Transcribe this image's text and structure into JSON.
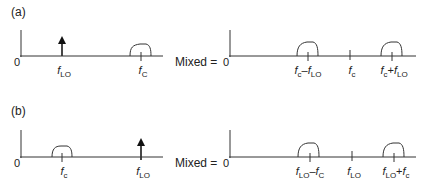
{
  "panels": [
    {
      "label": "(a)",
      "zero": "0",
      "mixed_label": "Mixed =",
      "input": {
        "components": [
          {
            "type": "impulse",
            "name": "f",
            "sub": "LO"
          },
          {
            "type": "band",
            "name": "f",
            "sub": "C"
          }
        ]
      },
      "output": {
        "components": [
          {
            "type": "band",
            "parts": [
              {
                "f": "f",
                "s": "c"
              },
              {
                "op": "–"
              },
              {
                "f": "f",
                "s": "LO"
              }
            ]
          },
          {
            "type": "tick",
            "parts": [
              {
                "f": "f",
                "s": "c"
              }
            ]
          },
          {
            "type": "band",
            "parts": [
              {
                "f": "f",
                "s": "c"
              },
              {
                "op": "+"
              },
              {
                "f": "f",
                "s": "LO"
              }
            ]
          }
        ]
      }
    },
    {
      "label": "(b)",
      "zero": "0",
      "mixed_label": "Mixed =",
      "input": {
        "components": [
          {
            "type": "band",
            "name": "f",
            "sub": "c"
          },
          {
            "type": "impulse",
            "name": "f",
            "sub": "LO"
          }
        ]
      },
      "output": {
        "components": [
          {
            "type": "band",
            "parts": [
              {
                "f": "f",
                "s": "LO"
              },
              {
                "op": "–"
              },
              {
                "f": "f",
                "s": "C"
              }
            ]
          },
          {
            "type": "tick",
            "parts": [
              {
                "f": "f",
                "s": "LO"
              }
            ]
          },
          {
            "type": "band",
            "parts": [
              {
                "f": "f",
                "s": "LO"
              },
              {
                "op": "+"
              },
              {
                "f": "f",
                "s": "c"
              }
            ]
          }
        ]
      }
    }
  ],
  "colors": {
    "line": "#333333",
    "text": "#222222",
    "background": "#ffffff"
  }
}
